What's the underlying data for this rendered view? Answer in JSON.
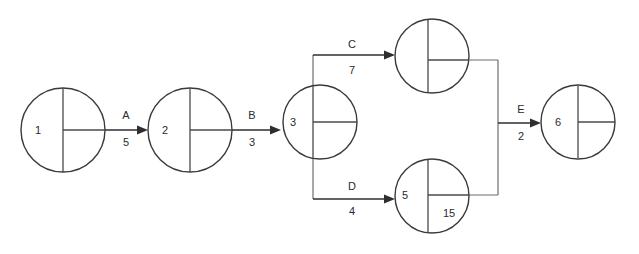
{
  "diagram": {
    "type": "activity-on-arrow-network",
    "background_color": "#ffffff",
    "line_color": "#2e2e2e",
    "route_color": "#6d6d6d",
    "text_color": "#2b2b2b",
    "nodes": [
      {
        "id": "node-1",
        "left_label": "1",
        "upper_right_label": "",
        "lower_right_label": "",
        "cx": 63,
        "cy": 130,
        "r": 42
      },
      {
        "id": "node-2",
        "left_label": "2",
        "upper_right_label": "",
        "lower_right_label": "",
        "cx": 190,
        "cy": 130,
        "r": 42
      },
      {
        "id": "node-3",
        "left_label": "3",
        "upper_right_label": "",
        "lower_right_label": "",
        "cx": 320,
        "cy": 122,
        "r": 37
      },
      {
        "id": "node-top",
        "left_label": "",
        "upper_right_label": "",
        "lower_right_label": "",
        "cx": 432,
        "cy": 56,
        "r": 37
      },
      {
        "id": "node-bottom",
        "left_label": "5",
        "upper_right_label": "",
        "lower_right_label": "15",
        "cx": 432,
        "cy": 196,
        "r": 37
      },
      {
        "id": "node-6",
        "left_label": "6",
        "upper_right_label": "",
        "lower_right_label": "",
        "cx": 578,
        "cy": 122,
        "r": 37
      }
    ],
    "edges": [
      {
        "id": "edge-a",
        "name": "A",
        "duration": "5",
        "from": "node-1",
        "to": "node-2",
        "name_x": 126,
        "name_y": 119,
        "duration_x": 126,
        "duration_y": 146
      },
      {
        "id": "edge-b",
        "name": "B",
        "duration": "3",
        "from": "node-2",
        "to": "node-3",
        "name_x": 252,
        "name_y": 119,
        "duration_x": 252,
        "duration_y": 146
      },
      {
        "id": "edge-c",
        "name": "C",
        "duration": "7",
        "from": "node-3",
        "to": "node-top",
        "name_x": 352,
        "name_y": 48,
        "duration_x": 352,
        "duration_y": 74
      },
      {
        "id": "edge-d",
        "name": "D",
        "duration": "4",
        "from": "node-3",
        "to": "node-bottom",
        "name_x": 352,
        "name_y": 190,
        "duration_x": 352,
        "duration_y": 215
      },
      {
        "id": "edge-e",
        "name": "E",
        "duration": "2",
        "from": "merge-junction",
        "to": "node-6",
        "name_x": 521,
        "name_y": 113,
        "duration_x": 521,
        "duration_y": 140
      }
    ]
  }
}
